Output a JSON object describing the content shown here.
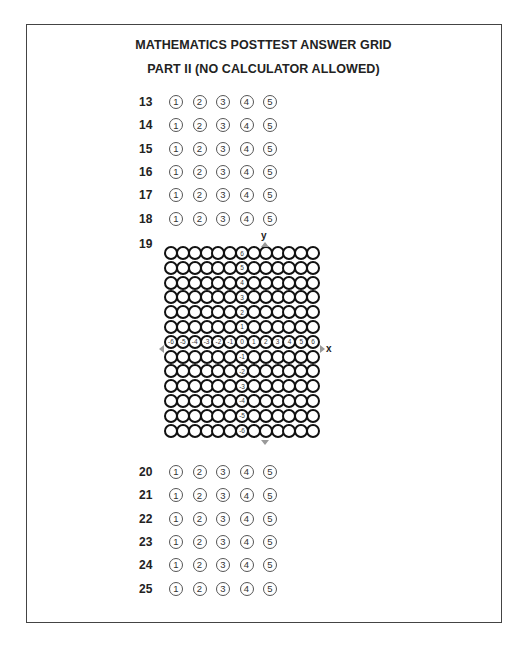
{
  "header": {
    "title_line1": "MATHEMATICS POSTTEST ANSWER GRID",
    "title_line2": "PART II (NO CALCULATOR ALLOWED)"
  },
  "choices": [
    "①",
    "②",
    "③",
    "④",
    "⑤"
  ],
  "questions_top": [
    {
      "number": "13"
    },
    {
      "number": "14"
    },
    {
      "number": "15"
    },
    {
      "number": "16"
    },
    {
      "number": "17"
    },
    {
      "number": "18"
    }
  ],
  "grid_question": {
    "number": "19",
    "x_axis_label": "x",
    "y_axis_label": "y",
    "x_labels": [
      "-6",
      "-5",
      "-4",
      "-3",
      "-2",
      "-1",
      "0",
      "1",
      "2",
      "3",
      "4",
      "5",
      "6"
    ],
    "y_labels": [
      "6",
      "5",
      "4",
      "3",
      "2",
      "1",
      "0",
      "-1",
      "-2",
      "-3",
      "-4",
      "-5",
      "-6"
    ]
  },
  "questions_bottom": [
    {
      "number": "20"
    },
    {
      "number": "21"
    },
    {
      "number": "22"
    },
    {
      "number": "23"
    },
    {
      "number": "24"
    },
    {
      "number": "25"
    }
  ]
}
